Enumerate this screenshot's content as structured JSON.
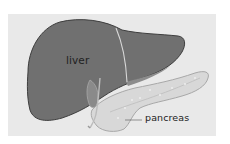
{
  "diagram": {
    "title": "",
    "labels": {
      "liver": "liver",
      "pancreas": "pancreas"
    },
    "organs": [
      {
        "name": "liver",
        "color": "#6f6f6f"
      },
      {
        "name": "pancreas",
        "color": "#d6d6d6"
      },
      {
        "name": "gallbladder",
        "color": "#8a8a8a"
      }
    ],
    "colors": {
      "background": "#ffffff",
      "panel": "#e9e9e9",
      "liver_fill": "#6f6f6f",
      "liver_outline": "#3c3c3c",
      "pancreas_fill": "#d6d6d6",
      "pancreas_outline": "#a9a9a9",
      "text": "#222222"
    }
  }
}
